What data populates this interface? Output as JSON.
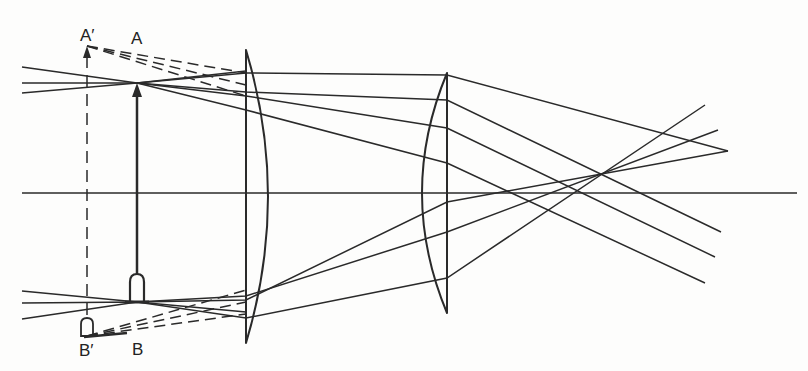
{
  "diagram": {
    "type": "optical ray diagram (two-lens system with virtual image)",
    "stroke_color": "#2a2a2a",
    "labels": {
      "A_prime": "A′",
      "A": "A",
      "B_prime": "B′",
      "B": "B"
    },
    "label_positions": {
      "A_prime": [
        80,
        27
      ],
      "A": [
        131,
        30
      ],
      "B_prime": [
        79,
        342
      ],
      "B": [
        132,
        341
      ]
    },
    "optical_axis": {
      "x1": 22,
      "y": 193,
      "x2": 797
    },
    "object_arrow": {
      "x": 137,
      "y_top": 83,
      "y_bottom": 302
    },
    "virtual_image": {
      "x": 87,
      "y_top": 46,
      "y_bottom": 336
    },
    "lens1": {
      "flat_x": 246,
      "bulge_x": 268,
      "y_top": 50,
      "y_bottom": 343
    },
    "lens2": {
      "flat_x": 447,
      "bulge_x": 422,
      "y_top": 73,
      "y_bottom": 313
    },
    "solid_rays": [
      {
        "points": [
          [
            22,
            67
          ],
          [
            137,
            83
          ],
          [
            246,
            92
          ],
          [
            447,
            100
          ],
          [
            721,
            232
          ]
        ]
      },
      {
        "points": [
          [
            22,
            83
          ],
          [
            137,
            83
          ],
          [
            246,
            73
          ],
          [
            447,
            75
          ],
          [
            728,
            151
          ]
        ]
      },
      {
        "points": [
          [
            22,
            93
          ],
          [
            137,
            83
          ],
          [
            246,
            71
          ]
        ]
      },
      {
        "points": [
          [
            137,
            83
          ],
          [
            246,
            96
          ],
          [
            447,
            128
          ],
          [
            715,
            257
          ]
        ]
      },
      {
        "points": [
          [
            137,
            83
          ],
          [
            246,
            110
          ],
          [
            447,
            163
          ],
          [
            705,
            283
          ]
        ]
      },
      {
        "points": [
          [
            22,
            291
          ],
          [
            137,
            302
          ],
          [
            246,
            312
          ]
        ]
      },
      {
        "points": [
          [
            22,
            303
          ],
          [
            137,
            302
          ],
          [
            246,
            318
          ],
          [
            447,
            278
          ],
          [
            705,
            105
          ]
        ]
      },
      {
        "points": [
          [
            22,
            319
          ],
          [
            137,
            302
          ],
          [
            246,
            296
          ],
          [
            447,
            232
          ],
          [
            718,
            130
          ]
        ]
      },
      {
        "points": [
          [
            137,
            302
          ],
          [
            246,
            300
          ],
          [
            447,
            202
          ],
          [
            728,
            151
          ]
        ]
      }
    ],
    "dashed_rays": [
      {
        "points": [
          [
            87,
            46
          ],
          [
            246,
            73
          ]
        ]
      },
      {
        "points": [
          [
            87,
            46
          ],
          [
            246,
            85
          ]
        ]
      },
      {
        "points": [
          [
            87,
            46
          ],
          [
            246,
            96
          ]
        ]
      },
      {
        "points": [
          [
            87,
            336
          ],
          [
            246,
            290
          ]
        ]
      },
      {
        "points": [
          [
            87,
            336
          ],
          [
            246,
            302
          ]
        ]
      },
      {
        "points": [
          [
            87,
            336
          ],
          [
            246,
            314
          ]
        ]
      }
    ]
  }
}
